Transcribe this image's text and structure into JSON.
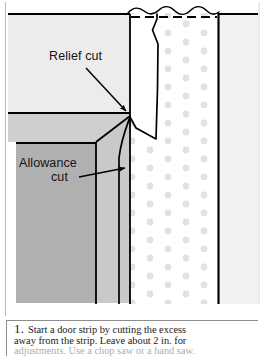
{
  "figure": {
    "name": "door-strip-relief-cut-diagram",
    "labels": [
      {
        "id": "relief_cut",
        "text": "Relief cut"
      },
      {
        "id": "allowance_cut_line1",
        "text": "Allowance"
      },
      {
        "id": "allowance_cut_line2",
        "text": "cut"
      }
    ],
    "colors": {
      "background": "#ffffff",
      "light_gray_panel": "#e8e8e8",
      "mid_gray_panel": "#cdcdcd",
      "dark_gray_panel": "#b3b3b3",
      "stipple_dot": "#e0e0e0",
      "line": "#000000",
      "rule": "#8d8d8d"
    }
  },
  "caption": {
    "step_number": "1.",
    "line1": "Start a door strip by cutting the excess",
    "line2": "away from the strip. Leave about 2 in. for",
    "line3": "adjustments. Use a chop saw or a hand saw."
  }
}
